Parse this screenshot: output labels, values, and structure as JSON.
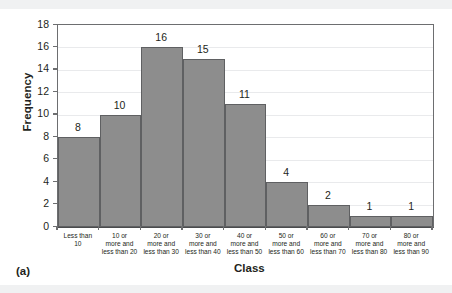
{
  "figure": {
    "panel_label": "(a)"
  },
  "chart_data": {
    "type": "bar",
    "title": "",
    "subtitle": "",
    "xlabel": "Class",
    "ylabel": "Frequency",
    "categories": [
      "Less than\n10",
      "10 or\nmore and\nless than 20",
      "20 or\nmore and\nless than 30",
      "30 or\nmore and\nless than 40",
      "40 or\nmore and\nless than 50",
      "50 or\nmore and\nless than 60",
      "60 or\nmore and\nless than 70",
      "70 or\nmore and\nless than 80",
      "80 or\nmore and\nless than 90"
    ],
    "values": [
      8,
      10,
      16,
      15,
      11,
      4,
      2,
      1,
      1
    ],
    "data_labels": [
      "8",
      "10",
      "16",
      "15",
      "11",
      "4",
      "2",
      "1",
      "1"
    ],
    "ylim": [
      0,
      18
    ],
    "ytick_values": [
      0,
      2,
      4,
      6,
      8,
      10,
      12,
      14,
      16,
      18
    ],
    "ytick_labels": [
      "0",
      "2",
      "4",
      "6",
      "8",
      "10",
      "12",
      "14",
      "16",
      "18"
    ],
    "grid": true,
    "legend": null,
    "bar_color": "#8d8d8d",
    "bar_edge_color": "#5f6062",
    "axis_color": "#6d6e70",
    "grid_color": "#e9eaec",
    "text_color": "#231f20"
  }
}
